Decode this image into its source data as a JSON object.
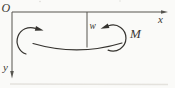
{
  "diagram": {
    "labels": {
      "origin": "O",
      "x_axis": "x",
      "y_axis": "y",
      "deflection": "w",
      "moment": "M"
    },
    "colors": {
      "background": "#fafaf8",
      "axis_stroke": "#56544f",
      "figure_stroke": "#35332f",
      "label_ink": "#3a3833"
    }
  }
}
